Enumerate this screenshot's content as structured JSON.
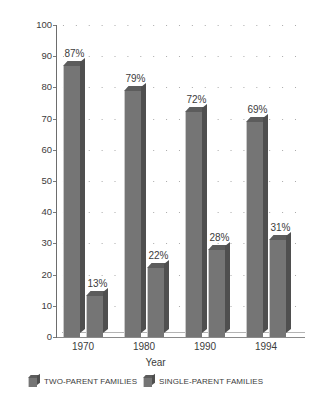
{
  "chart_data": {
    "type": "bar",
    "title": "",
    "xlabel": "Year",
    "ylabel": "Percent",
    "categories": [
      "1970",
      "1980",
      "1990",
      "1994"
    ],
    "ylim": [
      0,
      100
    ],
    "yticks": [
      0,
      10,
      20,
      30,
      40,
      50,
      60,
      70,
      80,
      90,
      100
    ],
    "ytick_labels": [
      "0",
      "10",
      "20",
      "30",
      "40",
      "50",
      "60",
      "70",
      "80",
      "90",
      "100"
    ],
    "grid": "dotted-horizontal",
    "legend_position": "bottom",
    "series": [
      {
        "name": "TWO-PARENT FAMILIES",
        "values": [
          87,
          79,
          72,
          69
        ],
        "data_labels": [
          "87%",
          "79%",
          "72%",
          "69%"
        ],
        "color": "#757575"
      },
      {
        "name": "SINGLE-PARENT FAMILIES",
        "values": [
          13,
          22,
          28,
          31
        ],
        "data_labels": [
          "13%",
          "22%",
          "28%",
          "31%"
        ],
        "color": "#757575"
      }
    ]
  },
  "axes": {
    "y_title": "Percent",
    "x_title": "Year"
  },
  "legend": {
    "items": [
      {
        "label": "TWO-PARENT FAMILIES"
      },
      {
        "label": "SINGLE-PARENT FAMILIES"
      }
    ]
  },
  "colors": {
    "bar_face": "#757575",
    "bar_side": "#4f4f4f",
    "bar_top": "#5c5c5c",
    "bar_highlight": "#c9c9c9",
    "axis": "#6d6d6d",
    "text": "#3c3c3c",
    "grid_dot": "#9a9a9a",
    "background": "#ffffff"
  }
}
